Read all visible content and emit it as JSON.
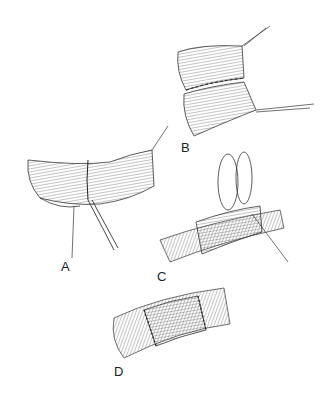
{
  "figure": {
    "panels": [
      {
        "id": "A",
        "label": "A",
        "description": "Open vessel ends with posterior wall sutured, forceps holding"
      },
      {
        "id": "B",
        "label": "B",
        "description": "Posterior wall anastomosis completed with running suture"
      },
      {
        "id": "C",
        "label": "C",
        "description": "Cuff/sleeve being sutured over vessel with looped stay sutures"
      },
      {
        "id": "D",
        "label": "D",
        "description": "Completed anastomosis with sleeve sutured at both ends"
      }
    ]
  }
}
